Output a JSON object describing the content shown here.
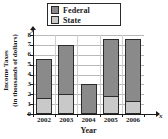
{
  "chart_data": {
    "type": "bar",
    "title": "",
    "subtitle": "",
    "stacked": true,
    "xlabel": "Year",
    "ylabel": "Income Taxes (in thousands of dollars)",
    "ylabel_line1": "Income Taxes",
    "ylabel_line2": "(in thousands of dollars)",
    "x_axis_letter": "x",
    "y_axis_letter": "y",
    "categories": [
      "2002",
      "2003",
      "2004",
      "2005",
      "2006"
    ],
    "ylim": [
      0,
      8
    ],
    "yticks": [
      0,
      1,
      2,
      3,
      4,
      5,
      6,
      7,
      8
    ],
    "ytick_labels": [
      "0",
      "1",
      "2",
      "3",
      "4",
      "5",
      "6",
      "7",
      "8"
    ],
    "grid": true,
    "legend_position": "top-center",
    "series": [
      {
        "name": "State",
        "color": "#c9c9c9",
        "values": [
          1.6,
          2.0,
          0,
          1.75,
          1.25
        ]
      },
      {
        "name": "Federal",
        "color": "#8a8a8a",
        "values": [
          4.0,
          5.0,
          3.0,
          5.85,
          6.35
        ]
      }
    ],
    "totals": [
      5.6,
      7.0,
      3.0,
      7.6,
      7.6
    ]
  },
  "legend": {
    "items": [
      {
        "label": "Federal",
        "color": "#8a8a8a"
      },
      {
        "label": "State",
        "color": "#c9c9c9"
      }
    ]
  },
  "colors": {
    "federal": "#8a8a8a",
    "state": "#c9c9c9",
    "axis": "#1a1a1a",
    "grid": "#b9b9b9",
    "background": "#ffffff"
  }
}
